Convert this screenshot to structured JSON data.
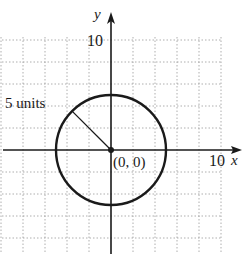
{
  "figure": {
    "x_axis_label": "x",
    "y_axis_label": "y",
    "x_tick_label": "10",
    "y_tick_label": "10",
    "radius_label": "5 units",
    "center_label": "(0, 0)",
    "colors": {
      "ink": "#1a1a1a",
      "grid": "#9a9a9a",
      "background": "#ffffff"
    }
  },
  "chart_data": {
    "type": "scatter",
    "title": "",
    "xlabel": "x",
    "ylabel": "y",
    "xlim": [
      -10,
      12
    ],
    "ylim": [
      -10,
      10
    ],
    "grid": true,
    "grid_step": 2,
    "x_ticks_labeled": [
      10
    ],
    "y_ticks_labeled": [
      10
    ],
    "circle": {
      "center": [
        0,
        0
      ],
      "radius": 5
    },
    "points": [
      {
        "x": 0,
        "y": 0,
        "label": "(0, 0)"
      }
    ],
    "radius_segment": {
      "from": [
        0,
        0
      ],
      "angle_deg": 135,
      "length": 5,
      "label": "5 units"
    }
  }
}
